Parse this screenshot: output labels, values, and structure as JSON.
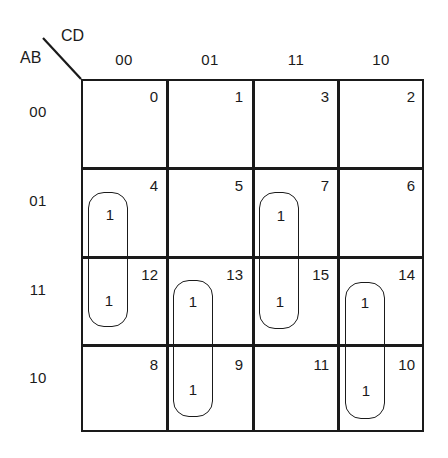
{
  "kmap": {
    "row_var": "AB",
    "col_var": "CD",
    "columns": [
      "00",
      "01",
      "11",
      "10"
    ],
    "rows": [
      "00",
      "01",
      "11",
      "10"
    ],
    "cell_indices": [
      [
        "0",
        "1",
        "3",
        "2"
      ],
      [
        "4",
        "5",
        "7",
        "6"
      ],
      [
        "12",
        "13",
        "15",
        "14"
      ],
      [
        "8",
        "9",
        "11",
        "10"
      ]
    ],
    "cell_values": [
      [
        "",
        "",
        "",
        ""
      ],
      [
        "1",
        "",
        "1",
        ""
      ],
      [
        "1",
        "1",
        "1",
        "1"
      ],
      [
        "",
        "1",
        "",
        "1"
      ]
    ],
    "groupings": [
      {
        "cells": [
          "4",
          "12"
        ],
        "label": "B C'D'"
      },
      {
        "cells": [
          "13",
          "9"
        ],
        "label": "A C'D"
      },
      {
        "cells": [
          "7",
          "15"
        ],
        "label": "B C D"
      },
      {
        "cells": [
          "14",
          "10"
        ],
        "label": "A C D'"
      }
    ]
  }
}
